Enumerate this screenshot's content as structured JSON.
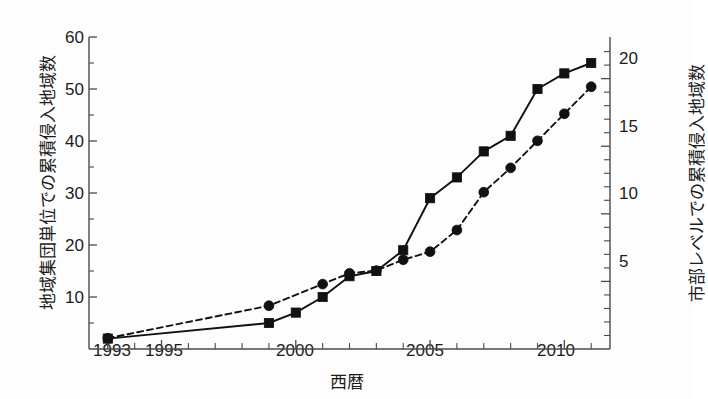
{
  "chart_data": {
    "type": "line",
    "title": "",
    "xlabel": "西暦",
    "ylabel": "地域集団単位での累積侵入地域数",
    "ylabel_right": "市部レベルでの累積侵入地域数",
    "xlim": [
      1992.3,
      2011.7
    ],
    "ylim": [
      0,
      60
    ],
    "ylim_right": [
      0,
      23.08
    ],
    "grid": false,
    "legend": "none",
    "x_ticks": [
      1993,
      1994,
      1995,
      1996,
      1997,
      1998,
      1999,
      2000,
      2001,
      2002,
      2003,
      2004,
      2005,
      2006,
      2007,
      2008,
      2009,
      2010,
      2011
    ],
    "x_tick_labels": [
      {
        "x": 1993,
        "label": "1993"
      },
      {
        "x": 1995,
        "label": "1995"
      },
      {
        "x": 2000,
        "label": "2000"
      },
      {
        "x": 2005,
        "label": "2005"
      },
      {
        "x": 2010,
        "label": "2010"
      }
    ],
    "y_ticks_left": [
      10,
      20,
      30,
      40,
      50,
      60
    ],
    "y_tick_labels_left": [
      "10",
      "20",
      "30",
      "40",
      "50",
      "60"
    ],
    "y_minor_ticks_left": [
      5,
      15,
      25,
      35,
      45,
      55
    ],
    "y_ticks_right": [
      5,
      10,
      15,
      20
    ],
    "y_tick_labels_right": [
      "5",
      "10",
      "15",
      "20"
    ],
    "y_minor_ticks_right": [
      1,
      2,
      3,
      4,
      6,
      7,
      8,
      9,
      11,
      12,
      13,
      14,
      16,
      17,
      18,
      19,
      21,
      22
    ],
    "series": [
      {
        "name": "地域集団単位での累積侵入地域数",
        "axis": "left",
        "line_style": "solid",
        "marker": "square",
        "color": "#111111",
        "x": [
          1993,
          1999,
          2000,
          2001,
          2002,
          2003,
          2004,
          2005,
          2006,
          2007,
          2008,
          2009,
          2010,
          2011
        ],
        "values": [
          2,
          5,
          7,
          10,
          14,
          15,
          19,
          29,
          33,
          38,
          41,
          50,
          53,
          55
        ]
      },
      {
        "name": "市部レベルでの累積侵入地域数",
        "axis": "right",
        "line_style": "dashed",
        "marker": "circle",
        "color": "#111111",
        "x": [
          1993,
          1999,
          2001,
          2002,
          2003,
          2004,
          2005,
          2006,
          2007,
          2008,
          2009,
          2010,
          2011
        ],
        "values": [
          0.8,
          3.2,
          4.8,
          5.6,
          5.8,
          6.6,
          7.2,
          8.8,
          11.6,
          13.4,
          15.4,
          17.4,
          19.4
        ]
      }
    ]
  },
  "axes": {
    "left_tick_labels": [
      "60",
      "50",
      "40",
      "30",
      "20",
      "10"
    ],
    "right_tick_labels": [
      "20",
      "15",
      "10",
      "5"
    ],
    "x_tick_labels": [
      "1993",
      "1995",
      "2000",
      "2005",
      "2010"
    ],
    "xlabel": "西暦",
    "ylabel_left": "地域集団単位での累積侵入地域数",
    "ylabel_right": "市部レベルでの累積侵入地域数"
  }
}
